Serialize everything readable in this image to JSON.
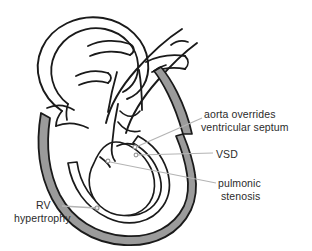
{
  "figure": {
    "background_color": "#ffffff",
    "outline_color": "#1a1a1a",
    "myocardium_fill": "#9b9b9b",
    "chamber_fill": "#ffffff",
    "leader_line_color": "#b0b0b0",
    "text_color": "#2b2b2b"
  },
  "labels": {
    "aorta_overrides_line1": "aorta overrides",
    "aorta_overrides_line2": "ventricular septum",
    "vsd": "VSD",
    "pulmonic_stenosis_line1": "pulmonic",
    "pulmonic_stenosis_line2": "stenosis",
    "rv_hypertrophy_line1": "RV",
    "rv_hypertrophy_line2": "hypertrophy"
  },
  "annotations": [
    {
      "id": "aorta-overrides-ventricular-septum",
      "text": "aorta overrides ventricular septum",
      "leader_from": [
        202,
        118
      ],
      "leader_to": [
        133,
        146
      ]
    },
    {
      "id": "vsd",
      "text": "VSD",
      "leader_from": [
        213,
        153
      ],
      "leader_to": [
        136,
        156
      ]
    },
    {
      "id": "pulmonic-stenosis",
      "text": "pulmonic stenosis",
      "leader_from": [
        215,
        184
      ],
      "leader_to": [
        108,
        161
      ]
    },
    {
      "id": "rv-hypertrophy",
      "text": "RV hypertrophy",
      "leader_from": [
        62,
        206
      ],
      "leader_to": [
        97,
        209
      ]
    }
  ]
}
